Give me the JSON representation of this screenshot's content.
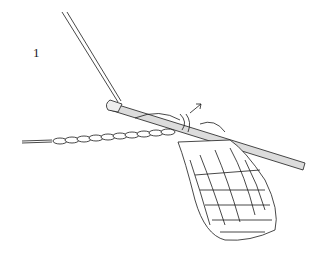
{
  "illustration": {
    "step_number": "1",
    "subject": "crochet hook working stitches onto a chain foundation",
    "colors": {
      "ink": "#1a1a1a",
      "hook": "#d9d9d9",
      "background": "#ffffff"
    }
  }
}
